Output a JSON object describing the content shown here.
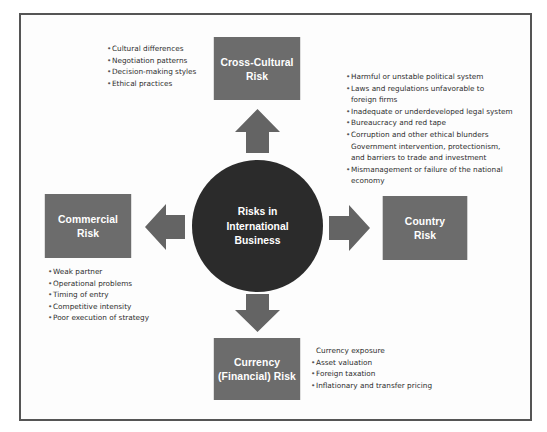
{
  "diagram": {
    "center": {
      "lines": [
        "Risks in",
        "International",
        "Business"
      ]
    },
    "colors": {
      "box_fill": "#6c6c6c",
      "circle_fill": "#2b2b2b",
      "arrow_fill": "#646464",
      "frame_border": "#555555",
      "label_text": "#ffffff",
      "body_text": "#2e2e2e"
    },
    "nodes": {
      "cross_cultural": {
        "lines": [
          "Cross-Cultural",
          "Risk"
        ],
        "arrow_direction": "up",
        "items": [
          "Cultural differences",
          "Negotiation patterns",
          "Decision-making styles",
          "Ethical practices"
        ]
      },
      "country": {
        "lines": [
          "Country",
          "Risk"
        ],
        "arrow_direction": "right",
        "items": [
          {
            "text": "Harmful or unstable political system",
            "bullet": true
          },
          {
            "text": "Laws and regulations unfavorable to",
            "bullet": true
          },
          {
            "text": "foreign firms",
            "bullet": false
          },
          {
            "text": "Inadequate or underdeveloped legal system",
            "bullet": true
          },
          {
            "text": "Bureaucracy and red tape",
            "bullet": true
          },
          {
            "text": "Corruption and other ethical blunders",
            "bullet": true
          },
          {
            "text": "Government intervention, protectionism,",
            "bullet": false
          },
          {
            "text": "and barriers to trade and investment",
            "bullet": false
          },
          {
            "text": "Mismanagement or failure of the national",
            "bullet": true
          },
          {
            "text": "economy",
            "bullet": false
          }
        ]
      },
      "commercial": {
        "lines": [
          "Commercial",
          "Risk"
        ],
        "arrow_direction": "left",
        "items": [
          "Weak partner",
          "Operational problems",
          "Timing of entry",
          "Competitive intensity",
          "Poor execution of strategy"
        ]
      },
      "currency": {
        "lines": [
          "Currency",
          "(Financial) Risk"
        ],
        "arrow_direction": "down",
        "items": [
          {
            "text": "Currency exposure",
            "bullet": false
          },
          {
            "text": "Asset valuation",
            "bullet": true
          },
          {
            "text": "Foreign taxation",
            "bullet": true
          },
          {
            "text": "Inflationary and transfer pricing",
            "bullet": true
          }
        ]
      }
    }
  }
}
